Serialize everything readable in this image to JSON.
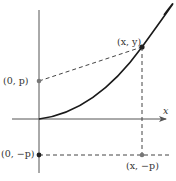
{
  "diagram": {
    "axes": {
      "x_label": "x"
    },
    "points": [
      {
        "id": "focus",
        "label": "(0, p)"
      },
      {
        "id": "curve_point",
        "label": "(x, y)"
      },
      {
        "id": "directrix_origin",
        "label": "(0, −p)"
      },
      {
        "id": "directrix_point",
        "label": "(x, −p)"
      }
    ],
    "colors": {
      "axis": "#555555",
      "curve": "#1a1a1a",
      "dashed": "#444444",
      "point_dark": "#222222",
      "point_gray": "#777777"
    }
  }
}
